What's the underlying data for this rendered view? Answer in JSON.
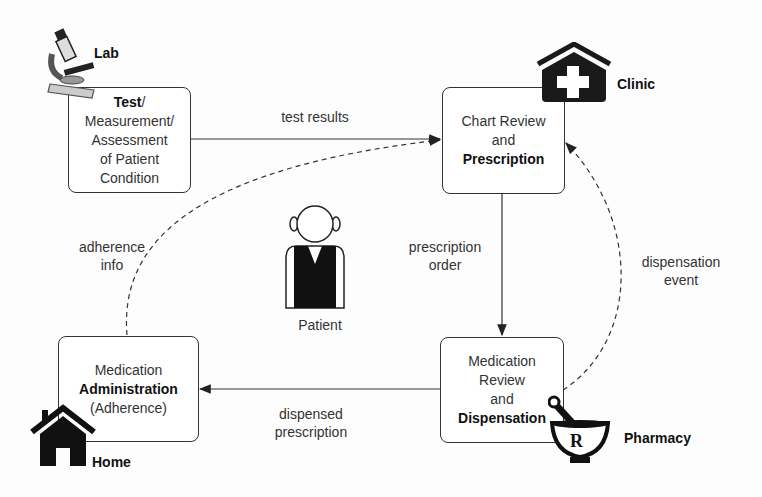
{
  "places": {
    "lab": "Lab",
    "clinic": "Clinic",
    "pharmacy": "Pharmacy",
    "home": "Home",
    "patient": "Patient"
  },
  "nodes": {
    "test": {
      "bold": "Test",
      "rest": [
        "/",
        "Measurement/",
        "Assessment",
        "of Patient",
        "Condition"
      ]
    },
    "chart": {
      "line1": "Chart Review",
      "line2": "and",
      "bold": "Prescription"
    },
    "dispense": {
      "line1": "Medication",
      "line2": "Review",
      "line3": "and",
      "bold": "Dispensation"
    },
    "admin": {
      "line1": "Medication",
      "bold": "Administration",
      "line3": "(Adherence)"
    }
  },
  "edges": {
    "test_results": "test results",
    "prescription_order": [
      "prescription",
      "order"
    ],
    "dispensation_event": [
      "dispensation",
      "event"
    ],
    "dispensed_prescription": [
      "dispensed",
      "prescription"
    ],
    "adherence_info": [
      "adherence",
      "info"
    ]
  },
  "colors": {
    "line": "#333333",
    "fill_dark": "#1a1a1a",
    "background": "#fdfdfd"
  }
}
